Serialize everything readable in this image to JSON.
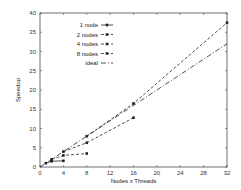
{
  "chart_data": {
    "type": "line",
    "title": "",
    "xlabel": "Nodes x Threads",
    "ylabel": "Speedup",
    "xlim": [
      0,
      32
    ],
    "ylim": [
      0,
      40
    ],
    "xticks": [
      0,
      4,
      8,
      12,
      16,
      20,
      24,
      28,
      32
    ],
    "yticks": [
      0,
      5,
      10,
      15,
      20,
      25,
      30,
      35,
      40
    ],
    "grid": false,
    "legend_position": "upper-left",
    "series": [
      {
        "name": "1 node",
        "style": "solid",
        "x": [
          1,
          2,
          4
        ],
        "y": [
          1,
          1.5,
          1.6
        ]
      },
      {
        "name": "2 nodes",
        "style": "dashed",
        "x": [
          2,
          4,
          8
        ],
        "y": [
          2,
          3,
          3.5
        ]
      },
      {
        "name": "4 nodes",
        "style": "dashed",
        "x": [
          4,
          8,
          16
        ],
        "y": [
          4,
          6.3,
          12.8
        ]
      },
      {
        "name": "8 nodes",
        "style": "dashed",
        "x": [
          8,
          16,
          32
        ],
        "y": [
          8,
          16.5,
          37.5
        ]
      },
      {
        "name": "ideal",
        "style": "dashdot",
        "x": [
          0,
          32
        ],
        "y": [
          0,
          32
        ]
      }
    ]
  }
}
